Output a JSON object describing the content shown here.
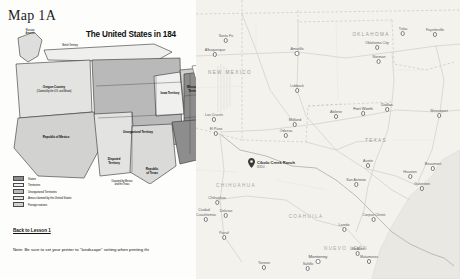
{
  "worksheet": {
    "page_title": "Map 1A",
    "map_title": "The United States in 184",
    "back_link": "Back to Lesson 1",
    "print_note": "Note: Be sure to set your printer to \"landscape\" setting when printing thi",
    "map_labels": [
      {
        "text": "Russian\nAmerica",
        "x": 26,
        "y": 6
      },
      {
        "text": "British Territory",
        "x": 62,
        "y": 20
      },
      {
        "text": "Oregon Country",
        "x": 52,
        "y": 62
      },
      {
        "text": "(Claimed by the U.S. and Britain)",
        "x": 52,
        "y": 67
      },
      {
        "text": "Unorganized Territory",
        "x": 116,
        "y": 105
      },
      {
        "text": "Iowa Territory",
        "x": 152,
        "y": 72
      },
      {
        "text": "Wisconsin",
        "x": 178,
        "y": 65
      },
      {
        "text": "Territory",
        "x": 178,
        "y": 69
      },
      {
        "text": "Republic of Mexico",
        "x": 52,
        "y": 112
      },
      {
        "text": "Disputed",
        "x": 112,
        "y": 137
      },
      {
        "text": "Territory",
        "x": 112,
        "y": 141
      },
      {
        "text": "Republic",
        "x": 146,
        "y": 148
      },
      {
        "text": "of Texas",
        "x": 146,
        "y": 152
      },
      {
        "text": "Disputed by Mexico",
        "x": 120,
        "y": 160
      },
      {
        "text": "and the Texas",
        "x": 120,
        "y": 164
      }
    ],
    "legend": [
      {
        "label": "States",
        "swatch": "sw-states"
      },
      {
        "label": "Territories",
        "swatch": "sw-terr"
      },
      {
        "label": "Unorganized Territories",
        "swatch": "sw-unorg"
      },
      {
        "label": "Areas claimed by the United States",
        "swatch": "sw-claim"
      },
      {
        "label": "Foreign nations",
        "swatch": "sw-foreign"
      }
    ]
  },
  "gmap": {
    "marker": {
      "label": "Cibolo Creek Ranch",
      "sub": "$350"
    },
    "states": [
      {
        "name": "NEW MEXICO",
        "x": 34,
        "y": 72
      },
      {
        "name": "OKLAHOMA",
        "x": 175,
        "y": 34
      },
      {
        "name": "TEXAS",
        "x": 180,
        "y": 140
      },
      {
        "name": "CHIHUAHUA",
        "x": 40,
        "y": 185,
        "mx": true
      },
      {
        "name": "COAHUILA",
        "x": 110,
        "y": 216,
        "mx": true
      },
      {
        "name": "NUEVO LEON",
        "x": 150,
        "y": 248,
        "mx": true
      }
    ],
    "cities": [
      {
        "name": "Santa Fe",
        "x": 30,
        "y": 38
      },
      {
        "name": "Albuquerque",
        "x": 19,
        "y": 52
      },
      {
        "name": "Amarillo",
        "x": 101,
        "y": 51
      },
      {
        "name": "Lubbock",
        "x": 101,
        "y": 88
      },
      {
        "name": "Oklahoma City",
        "x": 181,
        "y": 45
      },
      {
        "name": "Norman",
        "x": 183,
        "y": 59
      },
      {
        "name": "Tulsa",
        "x": 207,
        "y": 31
      },
      {
        "name": "Fayetteville",
        "x": 239,
        "y": 32
      },
      {
        "name": "Las Cruces",
        "x": 18,
        "y": 117
      },
      {
        "name": "El Paso",
        "x": 20,
        "y": 131
      },
      {
        "name": "Midland",
        "x": 99,
        "y": 122
      },
      {
        "name": "Odessa",
        "x": 90,
        "y": 133
      },
      {
        "name": "Abilene",
        "x": 140,
        "y": 114
      },
      {
        "name": "Fort Worth",
        "x": 167,
        "y": 110
      },
      {
        "name": "Dallas",
        "x": 191,
        "y": 106
      },
      {
        "name": "Shreveport",
        "x": 243,
        "y": 113
      },
      {
        "name": "Austin",
        "x": 172,
        "y": 163
      },
      {
        "name": "San Antonio",
        "x": 160,
        "y": 182
      },
      {
        "name": "Houston",
        "x": 214,
        "y": 174
      },
      {
        "name": "Beaumont",
        "x": 237,
        "y": 166
      },
      {
        "name": "Galveston",
        "x": 226,
        "y": 186
      },
      {
        "name": "Chihuahua",
        "x": 21,
        "y": 200
      },
      {
        "name": "Delicias",
        "x": 30,
        "y": 213
      },
      {
        "name": "Ciudad",
        "x": 8,
        "y": 212
      },
      {
        "name": "Cuauhtemoc",
        "x": 10,
        "y": 217
      },
      {
        "name": "Corpus Christi",
        "x": 178,
        "y": 217
      },
      {
        "name": "Laredo",
        "x": 148,
        "y": 227
      },
      {
        "name": "Parral",
        "x": 28,
        "y": 235
      },
      {
        "name": "Torreon",
        "x": 68,
        "y": 265
      },
      {
        "name": "Saltillo",
        "x": 112,
        "y": 266
      },
      {
        "name": "Monterrey",
        "x": 122,
        "y": 258
      },
      {
        "name": "McAllen",
        "x": 162,
        "y": 251
      },
      {
        "name": "Matamoros",
        "x": 173,
        "y": 259
      }
    ]
  }
}
